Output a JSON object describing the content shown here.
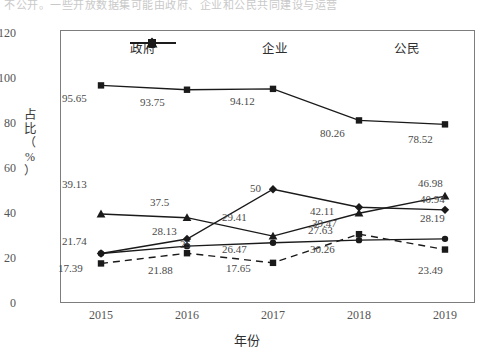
{
  "topstrip": {
    "text": "不公开。一些开放数据集可能由政府、企业和公民共同建设与运营"
  },
  "axes": {
    "y_title_chars": [
      "占",
      "比",
      "（",
      "%",
      "）"
    ],
    "y_ticks": [
      "0",
      "20",
      "40",
      "60",
      "80",
      "100",
      "120"
    ],
    "x_title": "年份",
    "x_ticks": [
      "2015",
      "2016",
      "2017",
      "2018",
      "2019"
    ]
  },
  "legend": [
    {
      "label": "政府",
      "marker": "square"
    },
    {
      "label": "企业",
      "marker": "diamond"
    },
    {
      "label": "公民",
      "marker": "triangle"
    }
  ],
  "chart_data": {
    "type": "line",
    "title": "",
    "xlabel": "年份",
    "ylabel": "占比（%）",
    "x": [
      "2015",
      "2016",
      "2017",
      "2018",
      "2019"
    ],
    "ylim": [
      0,
      120
    ],
    "ytick_step": 20,
    "grid": false,
    "legend_position": "top-inside",
    "series": [
      {
        "name": "政府",
        "marker": "square",
        "linestyle": "solid",
        "values": [
          95.65,
          93.75,
          94.12,
          80.26,
          78.52
        ],
        "labels": [
          "95.65",
          "93.75",
          "94.12",
          "80.26",
          "78.52"
        ]
      },
      {
        "name": "公民",
        "marker": "triangle",
        "linestyle": "solid",
        "values": [
          39.13,
          37.5,
          29.41,
          39.47,
          46.98
        ],
        "labels": [
          "39.13",
          "37.5",
          "29.41",
          "39.47",
          "46.98"
        ]
      },
      {
        "name": "企业",
        "marker": "diamond",
        "linestyle": "solid",
        "values": [
          21.74,
          28.13,
          50,
          42.11,
          40.94
        ],
        "labels": [
          "21.74",
          "28.13",
          "50",
          "42.11",
          "40.94"
        ]
      },
      {
        "name": "系列4",
        "marker": "circle",
        "linestyle": "solid",
        "values": [
          21.74,
          25,
          26.47,
          27.63,
          28.19
        ],
        "labels": [
          "21.74",
          "25",
          "26.47",
          "27.63",
          "28.19"
        ]
      },
      {
        "name": "系列5",
        "marker": "square",
        "linestyle": "dashed",
        "values": [
          17.39,
          21.88,
          17.65,
          30.26,
          23.49
        ],
        "labels": [
          "17.39",
          "21.88",
          "17.65",
          "30.26",
          "23.49"
        ]
      }
    ]
  },
  "value_labels": [
    {
      "text": "95.65",
      "x": 62,
      "y": 92
    },
    {
      "text": "93.75",
      "x": 140,
      "y": 96
    },
    {
      "text": "94.12",
      "x": 230,
      "y": 95
    },
    {
      "text": "80.26",
      "x": 320,
      "y": 127
    },
    {
      "text": "78.52",
      "x": 408,
      "y": 133
    },
    {
      "text": "39.13",
      "x": 62,
      "y": 178
    },
    {
      "text": "37.5",
      "x": 150,
      "y": 196
    },
    {
      "text": "29.41",
      "x": 222,
      "y": 211
    },
    {
      "text": "39.47",
      "x": 312,
      "y": 217
    },
    {
      "text": "46.98",
      "x": 418,
      "y": 177
    },
    {
      "text": "28.13",
      "x": 152,
      "y": 225
    },
    {
      "text": "50",
      "x": 250,
      "y": 182
    },
    {
      "text": "42.11",
      "x": 310,
      "y": 205
    },
    {
      "text": "40.94",
      "x": 420,
      "y": 193
    },
    {
      "text": "21.74",
      "x": 62,
      "y": 235
    },
    {
      "text": "25",
      "x": 180,
      "y": 238
    },
    {
      "text": "26.47",
      "x": 222,
      "y": 243
    },
    {
      "text": "27.63",
      "x": 308,
      "y": 224
    },
    {
      "text": "28.19",
      "x": 420,
      "y": 212
    },
    {
      "text": "17.39",
      "x": 58,
      "y": 262
    },
    {
      "text": "21.88",
      "x": 148,
      "y": 264
    },
    {
      "text": "17.65",
      "x": 226,
      "y": 262
    },
    {
      "text": "30.26",
      "x": 310,
      "y": 243
    },
    {
      "text": "23.49",
      "x": 418,
      "y": 264
    }
  ]
}
